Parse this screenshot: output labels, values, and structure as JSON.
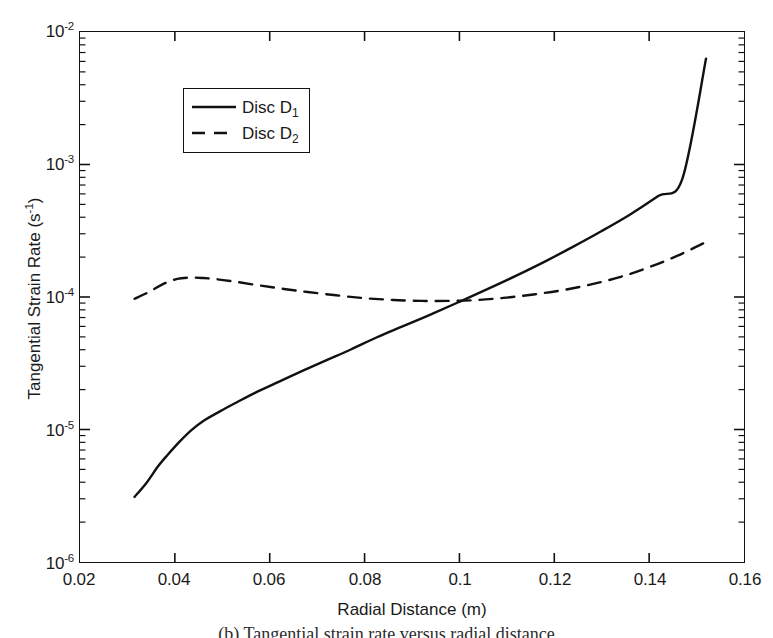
{
  "chart_data": {
    "type": "line",
    "title": "",
    "xlabel": "Radial Distance (m)",
    "ylabel": "Tangential Strain Rate (s-1)",
    "ylabel_base": "Tangential Strain Rate (s",
    "ylabel_exp": "-1",
    "ylabel_tail": ")",
    "xscale": "linear",
    "yscale": "log",
    "xlim": [
      0.02,
      0.16
    ],
    "ylim": [
      1e-06,
      0.01
    ],
    "grid": false,
    "legend_position": "upper left",
    "xticks": [
      0.02,
      0.04,
      0.06,
      0.08,
      0.1,
      0.12,
      0.14,
      0.16
    ],
    "xtick_labels": [
      "0.02",
      "0.04",
      "0.06",
      "0.08",
      "0.1",
      "0.12",
      "0.14",
      "0.16"
    ],
    "yticks": [
      1e-06,
      1e-05,
      0.0001,
      0.001,
      0.01
    ],
    "ytick_labels": [
      "10-6",
      "10-5",
      "10-4",
      "10-3",
      "10-2"
    ],
    "ytick_mantissa": "10",
    "ytick_exponents": [
      "-6",
      "-5",
      "-4",
      "-3",
      "-2"
    ],
    "minor_ticks": true,
    "series": [
      {
        "name": "Disc D1",
        "label_base": "Disc D",
        "label_sub": "1",
        "style": "solid",
        "color": "#111111",
        "x": [
          0.0315,
          0.034,
          0.0365,
          0.0385,
          0.041,
          0.0435,
          0.046,
          0.0495,
          0.053,
          0.057,
          0.062,
          0.067,
          0.072,
          0.077,
          0.0825,
          0.088,
          0.094,
          0.1,
          0.106,
          0.112,
          0.118,
          0.124,
          0.13,
          0.136,
          0.142,
          0.147,
          0.152
        ],
        "y": [
          3.1e-06,
          3.95e-06,
          5.3e-06,
          6.45e-06,
          8.1e-06,
          9.9e-06,
          1.16e-05,
          1.37e-05,
          1.6e-05,
          1.9e-05,
          2.3e-05,
          2.78e-05,
          3.34e-05,
          4e-05,
          4.95e-05,
          6e-05,
          7.4e-05,
          9.2e-05,
          0.000115,
          0.000145,
          0.000185,
          0.00024,
          0.000315,
          0.00042,
          0.00058,
          0.00078,
          0.0063
        ]
      },
      {
        "name": "Disc D2",
        "label_base": "Disc D",
        "label_sub": "2",
        "style": "dashed",
        "color": "#111111",
        "x": [
          0.0315,
          0.0345,
          0.0375,
          0.0405,
          0.0435,
          0.046,
          0.049,
          0.053,
          0.058,
          0.063,
          0.068,
          0.074,
          0.08,
          0.086,
          0.092,
          0.098,
          0.104,
          0.11,
          0.116,
          0.122,
          0.128,
          0.134,
          0.14,
          0.146,
          0.152
        ],
        "y": [
          9.7e-05,
          0.000109,
          0.000125,
          0.000137,
          0.00014,
          0.000139,
          0.000136,
          0.00013,
          0.000122,
          0.000115,
          0.000109,
          0.000103,
          9.8e-05,
          9.5e-05,
          9.35e-05,
          9.35e-05,
          9.5e-05,
          9.9e-05,
          0.000105,
          0.000113,
          0.000125,
          0.000142,
          0.000168,
          0.000205,
          0.00026
        ]
      }
    ],
    "annotations": [
      {
        "text": "curves cross",
        "x": 0.083,
        "y": 0.0001
      }
    ]
  },
  "legend": {
    "items": [
      {
        "label_base": "Disc D",
        "label_sub": "1",
        "style": "solid"
      },
      {
        "label_base": "Disc D",
        "label_sub": "2",
        "style": "dashed"
      }
    ]
  },
  "caption": {
    "text": "(b)  Tangential strain rate versus radial distance"
  }
}
